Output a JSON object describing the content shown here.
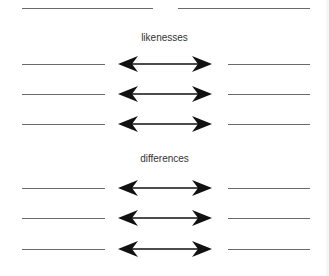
{
  "diagram": {
    "top_blanks": [
      {
        "x1": 22,
        "x2": 153,
        "y": 8
      },
      {
        "x1": 178,
        "x2": 310,
        "y": 8
      }
    ],
    "sections": [
      {
        "title": "likenesses",
        "title_y": 32,
        "rows": [
          {
            "y": 64
          },
          {
            "y": 94
          },
          {
            "y": 124
          }
        ]
      },
      {
        "title": "differences",
        "title_y": 153,
        "rows": [
          {
            "y": 188
          },
          {
            "y": 218
          },
          {
            "y": 249
          }
        ]
      }
    ],
    "connector_icon": "double-headed-arrow-icon",
    "colors": {
      "line": "#6a6a6a",
      "arrow": "#111111",
      "text": "#333333"
    }
  }
}
